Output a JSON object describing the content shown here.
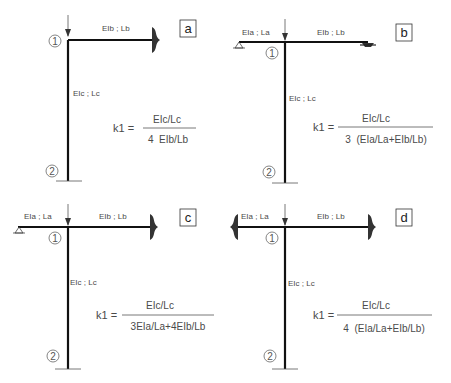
{
  "panels": [
    {
      "id": "a",
      "letter": "a",
      "beam_right_label": "EIb ; Lb",
      "column_label": "EIc ; Lc",
      "node_top": "1",
      "node_bottom": "2",
      "right_support": "fixed",
      "left_support": "none",
      "formula": {
        "lhs": "k1 =",
        "numerator": "EIc/Lc",
        "denominator": "4  EIb/Lb"
      }
    },
    {
      "id": "b",
      "letter": "b",
      "beam_left_label": "EIa ; La",
      "beam_right_label": "EIb ; Lb",
      "column_label": "EIc ; Lc",
      "node_top": "1",
      "node_bottom": "2",
      "left_support": "pinned",
      "right_support": "roller",
      "formula": {
        "lhs": "k1 =",
        "numerator": "EIc/Lc",
        "denominator": "3  (EIa/La+EIb/Lb)"
      }
    },
    {
      "id": "c",
      "letter": "c",
      "beam_left_label": "EIa ; La",
      "beam_right_label": "EIb ; Lb",
      "column_label": "EIc ; Lc",
      "node_top": "1",
      "node_bottom": "2",
      "left_support": "pinned",
      "right_support": "fixed",
      "formula": {
        "lhs": "k1 =",
        "numerator": "EIc/Lc",
        "denominator": "3EIa/La+4EIb/Lb"
      }
    },
    {
      "id": "d",
      "letter": "d",
      "beam_left_label": "EIa ; La",
      "beam_right_label": "EIb ; Lb",
      "column_label": "EIc ; Lc",
      "node_top": "1",
      "node_bottom": "2",
      "left_support": "fixed",
      "right_support": "fixed",
      "formula": {
        "lhs": "k1 =",
        "numerator": "EIc/Lc",
        "denominator": "4  (EIa/La+EIb/Lb)"
      }
    }
  ],
  "colors": {
    "member": "#111111",
    "text": "#4a4a4a",
    "support": "#333333"
  }
}
